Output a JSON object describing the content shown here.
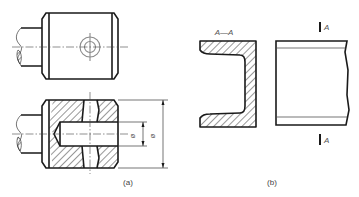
{
  "figure": {
    "panels": [
      {
        "id": "a",
        "caption": "(a)",
        "views": [
          "front-view",
          "section-view"
        ],
        "dimensions": [
          {
            "symbol": "ø",
            "target": "inner-bore-diameter"
          },
          {
            "symbol": "ø",
            "target": "outer-diameter"
          }
        ]
      },
      {
        "id": "b",
        "caption": "(b)",
        "section_label": "A—A",
        "cut_marks": [
          "A",
          "A"
        ]
      }
    ],
    "colors": {
      "line": "#1a1a1a",
      "hatch": "#1a1a1a",
      "center_line": "#444444",
      "hidden_circle": "#8a8a8a",
      "background": "#ffffff"
    }
  }
}
